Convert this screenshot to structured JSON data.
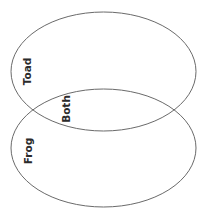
{
  "diagram": {
    "type": "venn",
    "stroke_color": "#6a6a6a",
    "text_color": "#2b2b2b",
    "sets": [
      {
        "id": "toad",
        "label": "Toad",
        "cx": 103.5,
        "cy": 71.5,
        "rx": 92.5,
        "ry": 59.5
      },
      {
        "id": "frog",
        "label": "Frog",
        "cx": 103.5,
        "cy": 148,
        "rx": 92.5,
        "ry": 59
      }
    ],
    "intersection": {
      "label": "Both"
    }
  }
}
